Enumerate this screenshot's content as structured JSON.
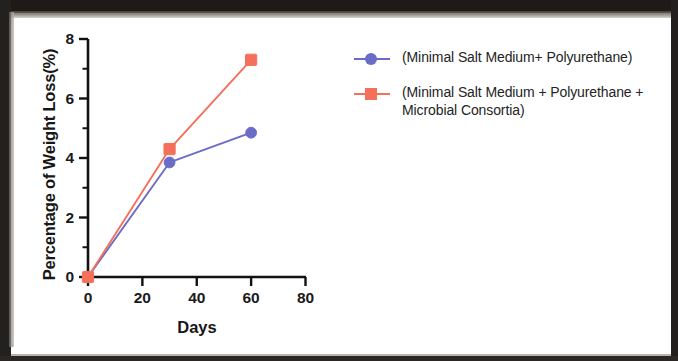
{
  "chart_data": {
    "type": "line",
    "title": "",
    "xlabel": "Days",
    "ylabel": "Percentage of Weight Loss(%)",
    "x": [
      0,
      30,
      60
    ],
    "xlim": [
      0,
      80
    ],
    "ylim": [
      0,
      8
    ],
    "xticks": [
      "0",
      "20",
      "40",
      "60",
      "80"
    ],
    "yticks": [
      "0",
      "2",
      "4",
      "6",
      "8"
    ],
    "xtick_values": [
      0,
      20,
      40,
      60,
      80
    ],
    "ytick_values": [
      0,
      2,
      4,
      6,
      8
    ],
    "grid": false,
    "legend_position": "right",
    "series": [
      {
        "name": "(Minimal Salt Medium+ Polyurethane)",
        "color": "#6B6BC8",
        "marker": "circle",
        "values": [
          0,
          3.85,
          4.85
        ]
      },
      {
        "name": "(Minimal Salt Medium + Polyurethane + Microbial Consortia)",
        "color": "#F4705A",
        "marker": "square",
        "values": [
          0,
          4.3,
          7.3
        ]
      }
    ]
  },
  "axes": {
    "x_title": "Days",
    "y_title": "Percentage of Weight Loss(%)",
    "x_tick_labels": [
      "0",
      "20",
      "40",
      "60",
      "80"
    ],
    "y_tick_labels": [
      "0",
      "2",
      "4",
      "6",
      "8"
    ]
  },
  "legend": {
    "entries": [
      {
        "label": "(Minimal Salt Medium+ Polyurethane)",
        "color": "#6B6BC8",
        "marker": "circle-marker"
      },
      {
        "label": "(Minimal Salt Medium + Polyurethane + Microbial Consortia)",
        "color": "#F4705A",
        "marker": "square-marker"
      }
    ]
  },
  "colors": {
    "series_blue": "#6B6BC8",
    "series_red": "#F4705A",
    "axis": "#111111",
    "text": "#1a1a1a",
    "background": "#ffffff"
  }
}
